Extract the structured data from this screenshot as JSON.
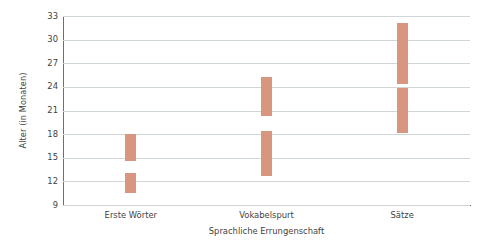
{
  "chart_data": {
    "type": "bar",
    "title": "",
    "subtitle": "",
    "xlabel": "Sprachliche Errungenschaft",
    "ylabel": "Alter (in Monaten)",
    "categories": [
      "Erste Wörter",
      "Vokabelspurt",
      "Sätze"
    ],
    "yticks": [
      9,
      12,
      15,
      18,
      21,
      24,
      27,
      30,
      33
    ],
    "ylim": [
      9,
      33
    ],
    "grid": true,
    "legend": null,
    "bar_color": "#d9967e",
    "gridline_color": "#cfd6d6",
    "axis_color": "#6f6f6f",
    "background": "#ffffff",
    "note": "Each category shows two floating range bars (low range and high range) of age in months.",
    "series": [
      {
        "name": "Unterer Bereich",
        "values": [
          {
            "category": "Erste Wörter",
            "low": 10.5,
            "high": 13.1
          },
          {
            "category": "Vokabelspurt",
            "low": 12.7,
            "high": 18.4
          },
          {
            "category": "Sätze",
            "low": 18.1,
            "high": 23.8
          }
        ]
      },
      {
        "name": "Oberer Bereich",
        "values": [
          {
            "category": "Erste Wörter",
            "low": 14.6,
            "high": 18.0
          },
          {
            "category": "Vokabelspurt",
            "low": 20.3,
            "high": 25.2
          },
          {
            "category": "Sätze",
            "low": 24.4,
            "high": 32.1
          }
        ]
      }
    ],
    "bars": [
      {
        "category": "Erste Wörter",
        "x_index": 0,
        "low": 10.5,
        "high": 13.1
      },
      {
        "category": "Erste Wörter",
        "x_index": 0,
        "low": 14.6,
        "high": 18.0
      },
      {
        "category": "Vokabelspurt",
        "x_index": 1,
        "low": 12.7,
        "high": 18.4
      },
      {
        "category": "Vokabelspurt",
        "x_index": 1,
        "low": 20.3,
        "high": 25.2
      },
      {
        "category": "Sätze",
        "x_index": 2,
        "low": 18.1,
        "high": 23.8
      },
      {
        "category": "Sätze",
        "x_index": 2,
        "low": 24.4,
        "high": 32.1
      }
    ]
  }
}
